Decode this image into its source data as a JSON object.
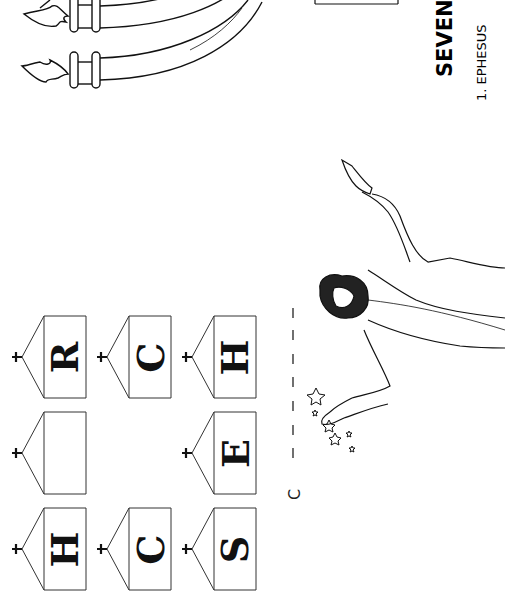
{
  "worksheet": {
    "title": "SEVEN CHU",
    "subtitle": "1. EPHESUS",
    "answer_prefix": "C",
    "answer_blanks": "_ _ _ _ _ _ _",
    "churches": [
      {
        "letter": "R"
      },
      {
        "letter": ""
      },
      {
        "letter": "H"
      },
      {
        "letter": "C"
      },
      {
        "letter": "C"
      },
      {
        "letter": "H"
      },
      {
        "letter": "E"
      },
      {
        "letter": "S"
      }
    ]
  },
  "colors": {
    "ink": "#111111",
    "paper": "#ffffff"
  }
}
